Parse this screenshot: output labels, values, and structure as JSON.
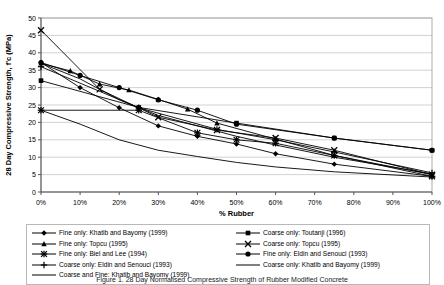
{
  "figure": {
    "caption": "Figure 1. 28 Day Normalised Compressive Strength of Rubber Modified Concrete"
  },
  "chart_data": {
    "type": "line",
    "title": "",
    "xlabel": "% Rubber",
    "ylabel": "28 Day Compressive Strength, f'c (MPa)",
    "xlim": [
      0,
      100
    ],
    "ylim": [
      0,
      50
    ],
    "xticks": [
      0,
      10,
      20,
      30,
      40,
      50,
      60,
      70,
      80,
      90,
      100
    ],
    "xtick_labels": [
      "0%",
      "10%",
      "20%",
      "30%",
      "40%",
      "50%",
      "60%",
      "70%",
      "80%",
      "90%",
      "100%"
    ],
    "yticks": [
      0,
      5,
      10,
      15,
      20,
      25,
      30,
      35,
      40,
      45,
      50
    ],
    "ytick_labels": [
      "0",
      "5",
      "10",
      "15",
      "20",
      "25",
      "30",
      "35",
      "40",
      "45",
      "50"
    ],
    "grid": "horizontal",
    "legend_position": "below",
    "series": [
      {
        "name": "Fine only: Khatib and Bayomy (1999)",
        "marker": "diamond",
        "color": "#000000",
        "x": [
          0,
          10,
          20,
          30,
          40,
          50,
          60,
          75,
          100
        ],
        "y": [
          37.2,
          30.0,
          24.2,
          19.0,
          16.0,
          13.8,
          11.0,
          8.0,
          4.5
        ]
      },
      {
        "name": "Coarse only: Toutanji (1996)",
        "marker": "square",
        "color": "#000000",
        "x": [
          0,
          25,
          50,
          75,
          100
        ],
        "y": [
          32.0,
          24.3,
          19.8,
          15.5,
          12.0
        ]
      },
      {
        "name": "Fine only: Topcu (1995)",
        "marker": "triangle",
        "color": "#000000",
        "x": [
          0,
          7.5,
          15,
          22.5,
          30,
          37.5,
          45,
          60,
          75,
          100
        ],
        "y": [
          37.0,
          34.8,
          31.0,
          29.3,
          26.6,
          23.8,
          19.8,
          15.2,
          10.5,
          5.0
        ]
      },
      {
        "name": "Coarse only: Topcu (1995)",
        "marker": "cross-x",
        "color": "#000000",
        "x": [
          0,
          15,
          30,
          45,
          60,
          75,
          100
        ],
        "y": [
          46.5,
          29.5,
          21.5,
          17.8,
          15.5,
          12.0,
          5.0
        ]
      },
      {
        "name": "Fine only: Biel and Lee (1994)",
        "marker": "star",
        "color": "#000000",
        "x": [
          0,
          25,
          40,
          50,
          60,
          75,
          100
        ],
        "y": [
          23.5,
          23.5,
          17.0,
          15.0,
          14.0,
          10.5,
          4.5
        ]
      },
      {
        "name": "Fine only: Eldin and Senouci (1993)",
        "marker": "circle",
        "color": "#000000",
        "x": [
          0,
          10,
          20,
          30,
          40,
          50,
          75,
          100
        ],
        "y": [
          37.2,
          33.5,
          30.0,
          26.5,
          23.5,
          19.5,
          15.5,
          12.0
        ]
      },
      {
        "name": "Coarse only: Eldin and Senouci (1993)",
        "marker": "plus",
        "color": "#000000",
        "x": [
          0,
          25,
          45,
          60,
          75,
          100
        ],
        "y": [
          36.0,
          24.2,
          18.0,
          15.0,
          11.5,
          5.5
        ]
      },
      {
        "name": "Coarse only: Khatib and Bayomy (1999)",
        "marker": "none",
        "color": "#000000",
        "x": [
          0,
          10,
          20,
          30,
          40,
          50,
          60,
          75,
          100
        ],
        "y": [
          37.0,
          32.5,
          26.5,
          22.0,
          19.0,
          16.0,
          13.5,
          10.0,
          5.2
        ]
      },
      {
        "name": "Coarse and Fine: Khatib and Bayomy (1999)",
        "marker": "none",
        "color": "#000000",
        "x": [
          0,
          10,
          20,
          30,
          40,
          50,
          60,
          75,
          100
        ],
        "y": [
          23.5,
          19.5,
          15.0,
          12.0,
          10.2,
          8.5,
          7.2,
          5.8,
          4.3
        ]
      }
    ]
  },
  "legend": {
    "left_column": [
      {
        "marker": "diamond",
        "label": "Fine only: Khatib and Bayomy (1999)"
      },
      {
        "marker": "triangle",
        "label": "Fine only: Topcu (1995)"
      },
      {
        "marker": "star",
        "label": "Fine only: Biel and Lee (1994)"
      },
      {
        "marker": "plus",
        "label": "Coarse only: Eldin and Senouci (1993)"
      },
      {
        "marker": "none",
        "label": "Coarse and Fine: Khatib and Bayomy (1999)"
      }
    ],
    "right_column": [
      {
        "marker": "square",
        "label": "Coarse only: Toutanji (1996)"
      },
      {
        "marker": "cross-x",
        "label": "Coarse only: Topcu (1995)"
      },
      {
        "marker": "circle",
        "label": "Fine only: Eldin and Senouci (1993)"
      },
      {
        "marker": "none",
        "label": "Coarse only: Khatib and Bayomy (1999)"
      }
    ]
  }
}
